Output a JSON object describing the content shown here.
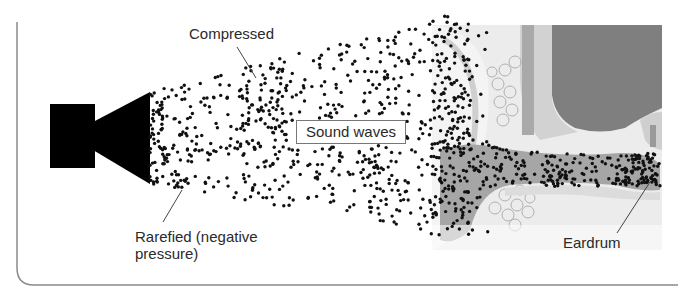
{
  "figure": {
    "top_caption_fragment": "Speech and grammar of the speaker",
    "labels": {
      "compressed": "Compressed",
      "sound_waves": "Sound waves",
      "rarefied_line1": "Rarefied (negative",
      "rarefied_line2": "pressure)",
      "eardrum": "Eardrum"
    },
    "elements": {
      "speaker": "loudspeaker-icon",
      "ear": "ear-cross-section-illustration",
      "dots": "air-particles"
    },
    "colors": {
      "ink": "#111111",
      "frame": "#8a8a8a",
      "ear_light": "#e6e6e6",
      "ear_mid": "#bdbdbd",
      "ear_dark": "#7d7d7d",
      "canal": "#a8a8a8",
      "text": "#2a2a2a"
    }
  }
}
